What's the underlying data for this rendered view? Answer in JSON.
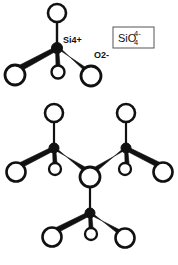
{
  "figure": {
    "background_color": "#ffffff",
    "stroke_color": "#111111",
    "atom_fill_color": "#ffffff",
    "si_fill_color": "#111111"
  },
  "labels": {
    "silicon_cation": "Si4+",
    "oxygen_anion": "O2-"
  },
  "formula_box": {
    "element": "SiO",
    "subscript": "4",
    "superscript": "4-",
    "full": "SiO4 4-",
    "border_color": "#555555"
  },
  "panels": [
    {
      "name": "isolated-tetrahedron",
      "caption": "Single SiO4 tetrahedron with central Si4+ and four O2- corners",
      "si_count": 1,
      "oxygen_count": 4
    },
    {
      "name": "linked-tetrahedra-network",
      "caption": "Three SiO4 tetrahedra sharing one bridging oxygen",
      "si_count": 3,
      "oxygen_count": 10,
      "bridging_oxygen_count": 1
    }
  ],
  "chemistry": {
    "central_atom": "Si",
    "coordinating_atom": "O",
    "coordination_number": 4,
    "ion_charge": "4-"
  }
}
